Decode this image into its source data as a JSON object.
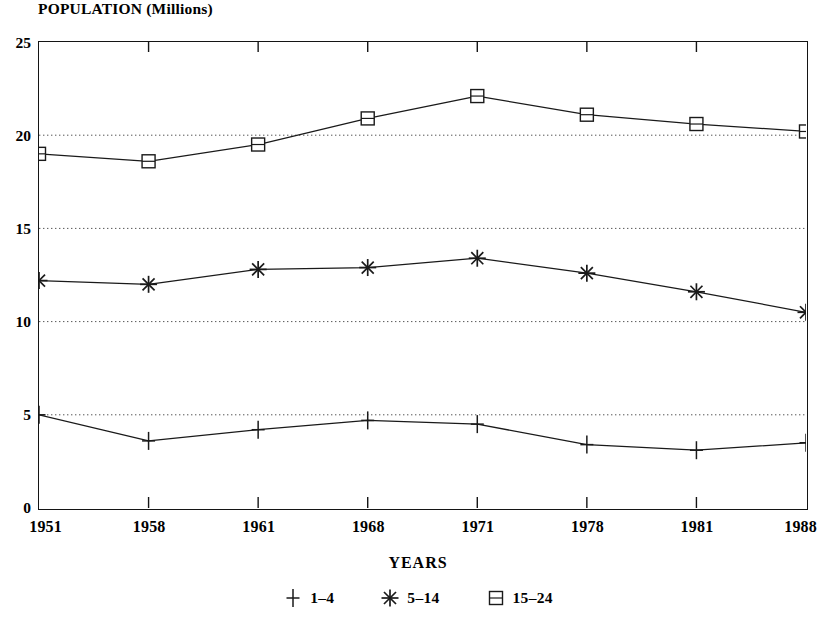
{
  "page": {
    "clipped_top_title": "",
    "y_axis_caption": "POPULATION (Millions)",
    "x_axis_caption": "YEARS"
  },
  "chart_data": {
    "type": "line",
    "title": "POPULATION (Millions)",
    "xlabel": "YEARS",
    "ylabel": "POPULATION (Millions)",
    "categories": [
      "1951",
      "1958",
      "1961",
      "1968",
      "1971",
      "1978",
      "1981",
      "1988"
    ],
    "x": [
      1951,
      1958,
      1961,
      1968,
      1971,
      1978,
      1981,
      1988
    ],
    "ylim": [
      0,
      25
    ],
    "yticks": [
      0,
      5,
      10,
      15,
      20,
      25
    ],
    "grid": "horizontal-dotted",
    "legend_position": "bottom-center",
    "series": [
      {
        "name": "1-4",
        "legend_label": "1–4",
        "marker": "plus",
        "values": [
          5.0,
          3.6,
          4.2,
          4.7,
          4.5,
          3.4,
          3.1,
          3.5
        ]
      },
      {
        "name": "5-14",
        "legend_label": "5–14",
        "marker": "asterisk",
        "values": [
          12.2,
          12.0,
          12.8,
          12.9,
          13.4,
          12.6,
          11.6,
          10.5
        ]
      },
      {
        "name": "15-24",
        "legend_label": "15–24",
        "marker": "square-barred",
        "values": [
          19.0,
          18.6,
          19.5,
          20.9,
          22.1,
          21.1,
          20.6,
          20.2
        ]
      }
    ],
    "colors": {
      "line": "#1a1a1a",
      "axis": "#141414",
      "grid": "#555555",
      "background": "#ffffff"
    }
  }
}
